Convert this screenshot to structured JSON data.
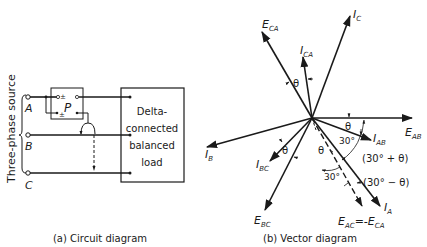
{
  "circuit": {
    "source_label": "Three-phase source",
    "terminals": [
      "A",
      "B",
      "C"
    ],
    "meter_label": "P",
    "meter_polarity": "±",
    "load_label_lines": [
      "Delta-",
      "connected",
      "balanced",
      "load"
    ],
    "caption": "(a) Circuit diagram"
  },
  "vector": {
    "caption": "(b) Vector diagram",
    "vectors": {
      "E_AB": {
        "main": "E",
        "sub": "AB"
      },
      "I_AB": {
        "main": "I",
        "sub": "AB"
      },
      "I_A": {
        "main": "I",
        "sub": "A"
      },
      "E_AC": {
        "main": "E",
        "sub": "AC",
        "suffix": "=-E",
        "suffix_sub": "CA"
      },
      "E_BC": {
        "main": "E",
        "sub": "BC"
      },
      "I_BC": {
        "main": "I",
        "sub": "BC"
      },
      "I_B": {
        "main": "I",
        "sub": "B"
      },
      "E_CA": {
        "main": "E",
        "sub": "CA"
      },
      "I_CA": {
        "main": "I",
        "sub": "CA"
      },
      "I_C": {
        "main": "I",
        "sub": "C"
      }
    },
    "angles": {
      "theta": "θ",
      "thirty": "30°",
      "thirty_plus_theta": "(30° + θ)",
      "thirty_minus_theta": "(30° − θ)"
    }
  }
}
